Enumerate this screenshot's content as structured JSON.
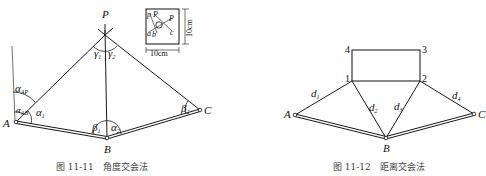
{
  "figure1": {
    "caption": "图 11-11　角度交会法",
    "points": {
      "P": "P",
      "A": "A",
      "B": "B",
      "C": "C"
    },
    "angles": {
      "alpha": "α",
      "beta": "β",
      "gamma": "γ",
      "sub_AP": "AP",
      "sub_AB": "AB",
      "sub_1": "1",
      "sub_2": "2"
    },
    "inset": {
      "labels": {
        "p": "p",
        "P": "P",
        "a": "a",
        "b": "b",
        "c": "c"
      },
      "width_label": "10cm",
      "height_label": "10cm"
    }
  },
  "figure2": {
    "caption": "图 11-12　距离交会法",
    "points": {
      "A": "A",
      "B": "B",
      "C": "C"
    },
    "corners": {
      "c1": "1",
      "c2": "2",
      "c3": "3",
      "c4": "4"
    },
    "distances": {
      "d": "d",
      "s1": "1",
      "s2": "2",
      "s3": "3",
      "s4": "4"
    }
  }
}
